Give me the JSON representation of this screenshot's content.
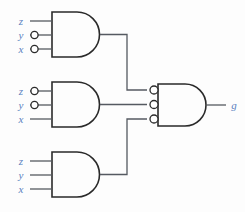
{
  "diagram": {
    "type": "logic-circuit",
    "colors": {
      "label": "#5a7fc0",
      "wire": "#555a61",
      "gate_outline": "#2a2a2a",
      "background": "#fdfdfd"
    },
    "gates": [
      {
        "id": "gate-1",
        "kind": "AND",
        "inputs": [
          {
            "label": "z",
            "inverted": false
          },
          {
            "label": "y",
            "inverted": true
          },
          {
            "label": "x",
            "inverted": true
          }
        ],
        "output_inverted": false
      },
      {
        "id": "gate-2",
        "kind": "AND",
        "inputs": [
          {
            "label": "z",
            "inverted": true
          },
          {
            "label": "y",
            "inverted": true
          },
          {
            "label": "x",
            "inverted": false
          }
        ],
        "output_inverted": false
      },
      {
        "id": "gate-3",
        "kind": "AND",
        "inputs": [
          {
            "label": "z",
            "inverted": false
          },
          {
            "label": "y",
            "inverted": false
          },
          {
            "label": "x",
            "inverted": false
          }
        ],
        "output_inverted": false
      },
      {
        "id": "gate-output",
        "kind": "AND",
        "inputs": [
          {
            "label": "",
            "inverted": true
          },
          {
            "label": "",
            "inverted": true
          },
          {
            "label": "",
            "inverted": true
          }
        ],
        "output_inverted": false,
        "output_label": "g"
      }
    ],
    "labels": {
      "g1_in1": "z",
      "g1_in2": "y",
      "g1_in3": "x",
      "g2_in1": "z",
      "g2_in2": "y",
      "g2_in3": "x",
      "g3_in1": "z",
      "g3_in2": "y",
      "g3_in3": "x",
      "output": "g"
    }
  }
}
